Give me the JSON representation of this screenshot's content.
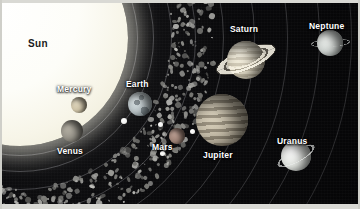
{
  "scene": {
    "title": "Solar System Illustration",
    "background_color": "#050506",
    "width": 360,
    "height": 209
  },
  "sun": {
    "label": "Sun",
    "color": "#fdfdf5",
    "label_color": "#1a1a1a",
    "cx": 20,
    "cy": 38,
    "r": 108
  },
  "planets": [
    {
      "name": "Mercury",
      "label": "Mercury",
      "cx": 79,
      "cy": 105,
      "r": 8,
      "color": "#cfc4a8",
      "label_x": 57,
      "label_y": 84,
      "moons": [],
      "rings": "none"
    },
    {
      "name": "Venus",
      "label": "Venus",
      "cx": 72,
      "cy": 131,
      "r": 11,
      "color": "#9a968c",
      "label_x": 57,
      "label_y": 146,
      "moons": [],
      "rings": "none"
    },
    {
      "name": "Earth",
      "label": "Earth",
      "cx": 140,
      "cy": 104,
      "r": 12,
      "color": "#b9c3c6",
      "label_x": 126,
      "label_y": 79,
      "moons": [
        {
          "cx": 124,
          "cy": 121,
          "r": 3
        }
      ],
      "rings": "none"
    },
    {
      "name": "Mars",
      "label": "Mars",
      "cx": 177,
      "cy": 136,
      "r": 8,
      "color": "#9d8276",
      "label_x": 152,
      "label_y": 142,
      "moons": [
        {
          "cx": 160,
          "cy": 124,
          "r": 2.5
        },
        {
          "cx": 162,
          "cy": 153,
          "r": 2.5
        },
        {
          "cx": 192,
          "cy": 131,
          "r": 2.5
        }
      ],
      "rings": "none"
    },
    {
      "name": "Jupiter",
      "label": "Jupiter",
      "cx": 222,
      "cy": 120,
      "r": 26,
      "color": "#b4ab97",
      "label_x": 203,
      "label_y": 150,
      "moons": [],
      "rings": "none"
    },
    {
      "name": "Saturn",
      "label": "Saturn",
      "cx": 246,
      "cy": 60,
      "r": 19,
      "color": "#ded7c2",
      "label_x": 230,
      "label_y": 24,
      "moons": [],
      "rings": "wide-tilted"
    },
    {
      "name": "Uranus",
      "label": "Uranus",
      "cx": 296,
      "cy": 156,
      "r": 15,
      "color": "#dfe2dd",
      "label_x": 277,
      "label_y": 136,
      "moons": [],
      "rings": "thin-tilted"
    },
    {
      "name": "Neptune",
      "label": "Neptune",
      "cx": 330,
      "cy": 43,
      "r": 13,
      "color": "#cdd2cf",
      "label_x": 309,
      "label_y": 21,
      "moons": [],
      "rings": "thin-horizontal"
    }
  ],
  "asteroid_belt": {
    "name": "asteroid-belt",
    "rock_color": "#8d8d8a",
    "description": "dense diagonal band of irregular rocks between Mars and Jupiter"
  },
  "orbits": {
    "color": "rgba(190,190,196,0.30)",
    "count": 8
  }
}
